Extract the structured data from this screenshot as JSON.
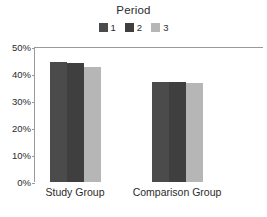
{
  "chart_data": {
    "type": "bar",
    "title": "Period",
    "xlabel": "",
    "ylabel": "",
    "categories": [
      "Study Group",
      "Comparison Group"
    ],
    "series": [
      {
        "name": "1",
        "values": [
          44.4,
          37.0
        ],
        "color": "#4b4b4b"
      },
      {
        "name": "2",
        "values": [
          44.1,
          37.0
        ],
        "color": "#3f3f3f"
      },
      {
        "name": "3",
        "values": [
          42.6,
          36.6
        ],
        "color": "#b6b6b6"
      }
    ],
    "ylim": [
      0,
      50
    ],
    "yticks": [
      0,
      10,
      20,
      30,
      40,
      50
    ],
    "ytick_labels": [
      "0%",
      "10%",
      "20%",
      "30%",
      "40%",
      "50%"
    ],
    "legend_position": "top-center",
    "grid": false,
    "value_format": "percent"
  },
  "legend": {
    "entries": [
      {
        "label": "1",
        "swatch_name": "legend-swatch-period-1"
      },
      {
        "label": "2",
        "swatch_name": "legend-swatch-period-2"
      },
      {
        "label": "3",
        "swatch_name": "legend-swatch-period-3"
      }
    ]
  },
  "axes": {
    "y_tick_labels": [
      "50%",
      "40%",
      "30%",
      "20%",
      "10%",
      "0%"
    ],
    "x_tick_labels": [
      "Study Group",
      "Comparison Group"
    ]
  },
  "colors": {
    "series_1": "#4b4b4b",
    "series_2": "#3f3f3f",
    "series_3": "#b6b6b6",
    "axis": "#9a9a9a",
    "text": "#2b2b2b",
    "background": "#ffffff"
  }
}
